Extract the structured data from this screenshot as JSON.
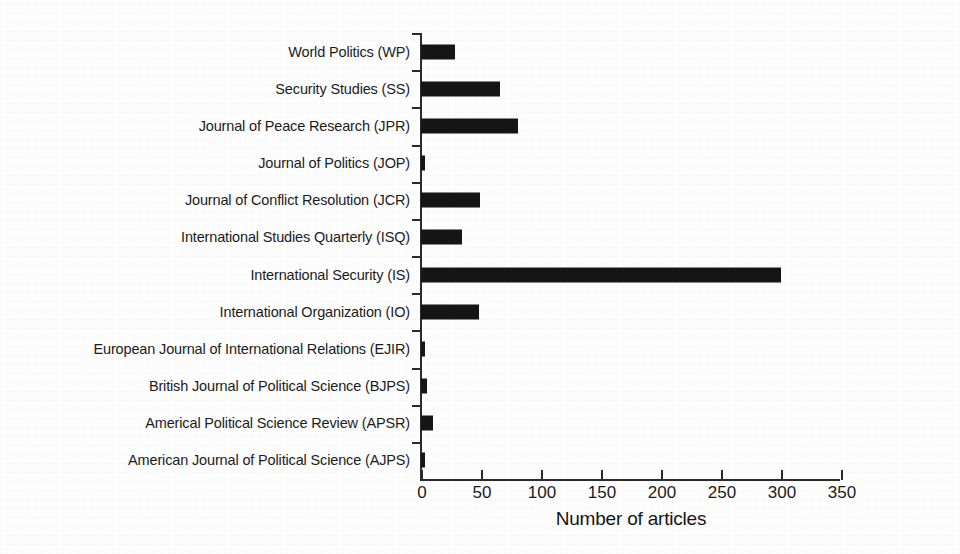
{
  "chart_data": {
    "type": "bar",
    "orientation": "horizontal",
    "title": "",
    "xlabel": "Number of articles",
    "ylabel": "",
    "xlim": [
      0,
      350
    ],
    "xticks": [
      0,
      50,
      100,
      150,
      200,
      250,
      300,
      350
    ],
    "grid": false,
    "legend": null,
    "bar_color": "#151515",
    "axis_color": "#2b2b2b",
    "categories": [
      "World Politics (WP)",
      "Security Studies (SS)",
      "Journal of Peace Research (JPR)",
      "Journal of Politics (JOP)",
      "Journal of Conflict Resolution (JCR)",
      "International Studies Quarterly (ISQ)",
      "International Security (IS)",
      "International Organization (IO)",
      "European Journal of International Relations (EJIR)",
      "British Journal of Political Science (BJPS)",
      "Americal Political Science Review (APSR)",
      "American Journal of Political Science (AJPS)"
    ],
    "values": [
      28,
      66,
      81,
      3,
      49,
      34,
      300,
      48,
      3,
      5,
      10,
      3
    ]
  }
}
